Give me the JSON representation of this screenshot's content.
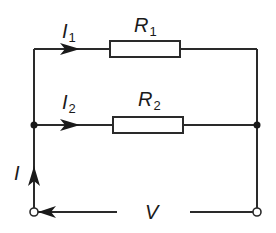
{
  "diagram": {
    "labels": {
      "i1": {
        "main": "I",
        "sub": "1"
      },
      "i2": {
        "main": "I",
        "sub": "2"
      },
      "r1": {
        "main": "R",
        "sub": "1"
      },
      "r2": {
        "main": "R",
        "sub": "2"
      },
      "i": "I",
      "v": "V"
    },
    "colors": {
      "line": "#2a2a2a",
      "background": "#ffffff"
    }
  }
}
